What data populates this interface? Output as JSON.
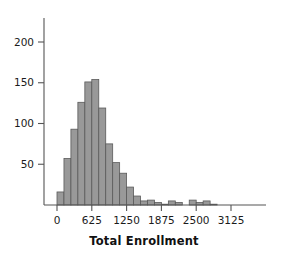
{
  "chart_data": {
    "type": "bar",
    "title": "",
    "subtitle": "",
    "xlabel": "Total Enrollment",
    "ylabel": "",
    "xlim": [
      -190,
      3320
    ],
    "ylim": [
      0,
      225
    ],
    "grid": false,
    "legend": null,
    "bin_width": 125,
    "bar_color": "#999999",
    "bar_edge_color": "#5a5a5a",
    "axis_color": "#555555",
    "x_ticks": [
      0,
      625,
      1250,
      1875,
      2500,
      3125
    ],
    "x_tick_labels": [
      "0",
      "625",
      "1250",
      "1875",
      "2500",
      "3125"
    ],
    "y_ticks": [
      50,
      100,
      150,
      200
    ],
    "y_tick_labels": [
      "50",
      "100",
      "150",
      "200"
    ],
    "bin_starts": [
      0,
      125,
      250,
      375,
      500,
      625,
      750,
      875,
      1000,
      1125,
      1250,
      1375,
      1500,
      1625,
      1750,
      1875,
      2000,
      2125,
      2250,
      2375,
      2500,
      2625,
      2750,
      2875
    ],
    "values": [
      16,
      57,
      93,
      126,
      151,
      154,
      119,
      75,
      52,
      39,
      22,
      11,
      5,
      6,
      3,
      1,
      5,
      3,
      0,
      6,
      3,
      5,
      1,
      0
    ],
    "categories": [
      "0-125",
      "125-250",
      "250-375",
      "375-500",
      "500-625",
      "625-750",
      "750-875",
      "875-1000",
      "1000-1125",
      "1125-1250",
      "1250-1375",
      "1375-1500",
      "1500-1625",
      "1625-1750",
      "1750-1875",
      "1875-2000",
      "2000-2125",
      "2125-2250",
      "2250-2375",
      "2375-2500",
      "2500-2625",
      "2625-2750",
      "2750-2875",
      "2875-3000"
    ]
  },
  "axis": {
    "x_title": "Total Enrollment"
  }
}
